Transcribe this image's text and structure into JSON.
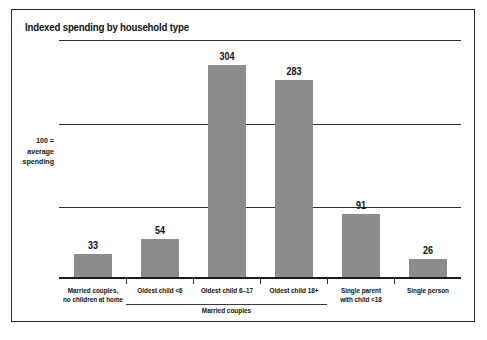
{
  "figure": {
    "title": "Indexed spending by household type",
    "y_axis_caption_lines": [
      "100 =",
      "average",
      "spending"
    ],
    "group_bracket_label": "Married couples",
    "bar_color": "#8c8c8c",
    "frame_color": "#2b2b2b",
    "gridline_color": "#2e2e2e",
    "baseline_color": "#1a1a1a"
  },
  "chart_data": {
    "type": "bar",
    "title": "Indexed spending by household type",
    "xlabel": "",
    "ylabel": "100 = average spending",
    "ylim": [
      0,
      340
    ],
    "grid": true,
    "gridlines": [
      100,
      220,
      340
    ],
    "legend": "none",
    "categories": [
      "Married couples, no children at home",
      "Oldest child <6",
      "Oldest child 6–17",
      "Oldest child 18+",
      "Single parent with child <18",
      "Single person"
    ],
    "category_label_lines": [
      [
        "Married couples,",
        "no children at home"
      ],
      [
        "Oldest child <6"
      ],
      [
        "Oldest child 6–17"
      ],
      [
        "Oldest child 18+"
      ],
      [
        "Single parent",
        "with child <18"
      ],
      [
        "Single person"
      ]
    ],
    "values": [
      33,
      54,
      304,
      283,
      91,
      26
    ],
    "value_labels": [
      "33",
      "54",
      "304",
      "283",
      "91",
      "26"
    ],
    "groups": [
      {
        "label": "Married couples",
        "member_indices": [
          1,
          2,
          3
        ]
      }
    ]
  }
}
